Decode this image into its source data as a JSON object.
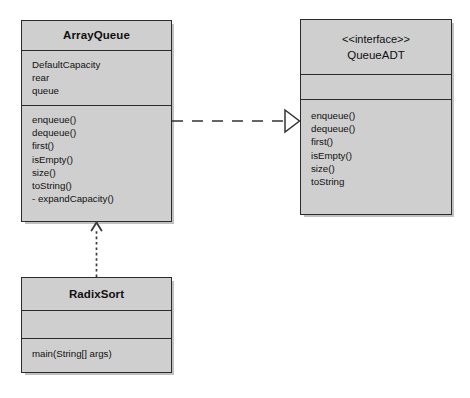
{
  "diagram": {
    "type": "uml-class-diagram",
    "background_color": "#ffffff",
    "box_fill_color": "#cfcfcf",
    "box_border_color": "#2b2b2b",
    "classes": [
      {
        "id": "arrayqueue",
        "name": "ArrayQueue",
        "stereotype": "",
        "attributes": [
          "DefaultCapacity",
          "rear",
          "queue"
        ],
        "operations": [
          "enqueue()",
          "dequeue()",
          "first()",
          "isEmpty()",
          "size()",
          "toString()",
          "- expandCapacity()"
        ]
      },
      {
        "id": "queueadt",
        "name": "QueueADT",
        "stereotype": "<<interface>>",
        "attributes": [],
        "operations": [
          "enqueue()",
          "dequeue()",
          "first()",
          "isEmpty()",
          "size()",
          "toString"
        ]
      },
      {
        "id": "radixsort",
        "name": "RadixSort",
        "stereotype": "",
        "attributes": [],
        "operations": [
          "main(String[] args)"
        ]
      }
    ],
    "relationships": [
      {
        "id": "realization",
        "kind": "realization",
        "line_style": "dashed",
        "arrow_head": "hollow-triangle",
        "from": "ArrayQueue",
        "to": "QueueADT",
        "label": ""
      },
      {
        "id": "dependency",
        "kind": "dependency",
        "line_style": "dotted",
        "arrow_head": "open-arrow",
        "from": "RadixSort",
        "to": "ArrayQueue",
        "label": ""
      }
    ]
  }
}
